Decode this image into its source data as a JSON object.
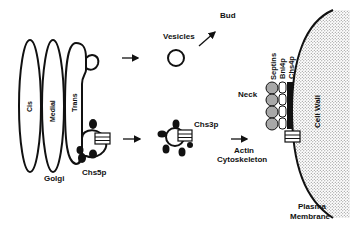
{
  "diagram": {
    "golgi": {
      "label": "Golgi",
      "cisternae": [
        "Cis",
        "Medial",
        "Trans"
      ]
    },
    "pathway_top": {
      "vesicles_label": "Vesicles",
      "bud_label": "Bud"
    },
    "pathway_bottom": {
      "chs5p_label": "Chs5p",
      "chs3p_label": "Chs3p",
      "transport_label_line1": "Actin",
      "transport_label_line2": "Cytoskeleton"
    },
    "neck": {
      "label": "Neck",
      "layers": [
        "Septins",
        "Bni4p",
        "Chs4p"
      ]
    },
    "cell_wall_label": "Cell Wall",
    "membrane_label_line1": "Plasma",
    "membrane_label_line2": "Membrane",
    "colors": {
      "line": "#111111",
      "septin_fill": "#a8a8a8",
      "wall_dots": "#777777",
      "background": "#ffffff"
    }
  }
}
